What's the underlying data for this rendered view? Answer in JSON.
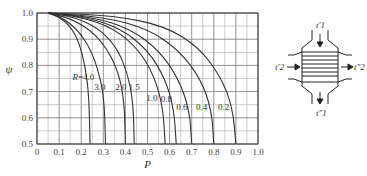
{
  "chart_data": {
    "type": "line",
    "title": "",
    "xlabel": "P",
    "ylabel": "ψ",
    "xlim": [
      0,
      1.0
    ],
    "ylim": [
      0.5,
      1.0
    ],
    "x_ticks": [
      "0",
      "0.1",
      "0.2",
      "0.3",
      "0.4",
      "0.5",
      "0.6",
      "0.7",
      "0.8",
      "0.9",
      "1.0"
    ],
    "y_ticks": [
      "0.5",
      "0.6",
      "0.7",
      "0.8",
      "0.9",
      "1.0"
    ],
    "grid": true,
    "grid_minor_step_x": 0.05,
    "grid_minor_step_y": 0.05,
    "legend": "inline curve labels",
    "series": [
      {
        "name": "R=4.0",
        "label": "R=4.0",
        "p_at_psi_0_5": 0.24,
        "points": [
          [
            0.05,
            1.0
          ],
          [
            0.1,
            0.985
          ],
          [
            0.15,
            0.95
          ],
          [
            0.19,
            0.89
          ],
          [
            0.22,
            0.79
          ],
          [
            0.235,
            0.68
          ],
          [
            0.24,
            0.5
          ]
        ]
      },
      {
        "name": "R=3.0",
        "label": "3.0",
        "p_at_psi_0_5": 0.31,
        "points": [
          [
            0.05,
            1.0
          ],
          [
            0.12,
            0.98
          ],
          [
            0.19,
            0.93
          ],
          [
            0.25,
            0.85
          ],
          [
            0.29,
            0.74
          ],
          [
            0.305,
            0.65
          ],
          [
            0.31,
            0.5
          ]
        ]
      },
      {
        "name": "R=2.0",
        "label": "2.0",
        "p_at_psi_0_5": 0.4,
        "points": [
          [
            0.05,
            1.0
          ],
          [
            0.15,
            0.98
          ],
          [
            0.25,
            0.93
          ],
          [
            0.32,
            0.86
          ],
          [
            0.37,
            0.77
          ],
          [
            0.395,
            0.66
          ],
          [
            0.4,
            0.5
          ]
        ]
      },
      {
        "name": "R=1.5",
        "label": "1.5",
        "p_at_psi_0_5": 0.44,
        "points": [
          [
            0.05,
            1.0
          ],
          [
            0.17,
            0.985
          ],
          [
            0.28,
            0.94
          ],
          [
            0.36,
            0.87
          ],
          [
            0.41,
            0.77
          ],
          [
            0.435,
            0.66
          ],
          [
            0.44,
            0.5
          ]
        ]
      },
      {
        "name": "R=1.0",
        "label": "1.0",
        "p_at_psi_0_5": 0.58,
        "points": [
          [
            0.05,
            1.0
          ],
          [
            0.2,
            0.985
          ],
          [
            0.35,
            0.94
          ],
          [
            0.46,
            0.86
          ],
          [
            0.53,
            0.76
          ],
          [
            0.57,
            0.64
          ],
          [
            0.58,
            0.5
          ]
        ]
      },
      {
        "name": "R=0.8",
        "label": "0.8",
        "p_at_psi_0_5": 0.63,
        "points": [
          [
            0.05,
            1.0
          ],
          [
            0.22,
            0.985
          ],
          [
            0.38,
            0.94
          ],
          [
            0.5,
            0.86
          ],
          [
            0.58,
            0.75
          ],
          [
            0.62,
            0.63
          ],
          [
            0.63,
            0.5
          ]
        ]
      },
      {
        "name": "R=0.6",
        "label": "0.6",
        "p_at_psi_0_5": 0.7,
        "points": [
          [
            0.05,
            1.0
          ],
          [
            0.25,
            0.985
          ],
          [
            0.42,
            0.94
          ],
          [
            0.55,
            0.86
          ],
          [
            0.64,
            0.75
          ],
          [
            0.69,
            0.63
          ],
          [
            0.7,
            0.5
          ]
        ]
      },
      {
        "name": "R=0.4",
        "label": "0.4",
        "p_at_psi_0_5": 0.8,
        "points": [
          [
            0.05,
            1.0
          ],
          [
            0.3,
            0.985
          ],
          [
            0.5,
            0.94
          ],
          [
            0.64,
            0.86
          ],
          [
            0.74,
            0.75
          ],
          [
            0.79,
            0.63
          ],
          [
            0.8,
            0.5
          ]
        ]
      },
      {
        "name": "R=0.2",
        "label": "0.2",
        "p_at_psi_0_5": 0.9,
        "points": [
          [
            0.05,
            1.0
          ],
          [
            0.35,
            0.99
          ],
          [
            0.58,
            0.95
          ],
          [
            0.73,
            0.87
          ],
          [
            0.83,
            0.76
          ],
          [
            0.885,
            0.64
          ],
          [
            0.9,
            0.5
          ]
        ]
      }
    ],
    "curve_labels": [
      {
        "text": "R=4.0",
        "x": 0.21,
        "y": 0.745
      },
      {
        "text": "3.0",
        "x": 0.285,
        "y": 0.705
      },
      {
        "text": "2.0",
        "x": 0.38,
        "y": 0.705
      },
      {
        "text": "1.5",
        "x": 0.44,
        "y": 0.705
      },
      {
        "text": "1.0",
        "x": 0.52,
        "y": 0.665
      },
      {
        "text": "0.8",
        "x": 0.585,
        "y": 0.66
      },
      {
        "text": "0.6",
        "x": 0.655,
        "y": 0.63
      },
      {
        "text": "0.4",
        "x": 0.745,
        "y": 0.63
      },
      {
        "text": "0.2",
        "x": 0.845,
        "y": 0.63
      }
    ]
  },
  "diagram": {
    "inlet_top": "t′1",
    "outlet_bottom": "t″1",
    "inlet_left": "t′2",
    "outlet_right": "t″2"
  }
}
